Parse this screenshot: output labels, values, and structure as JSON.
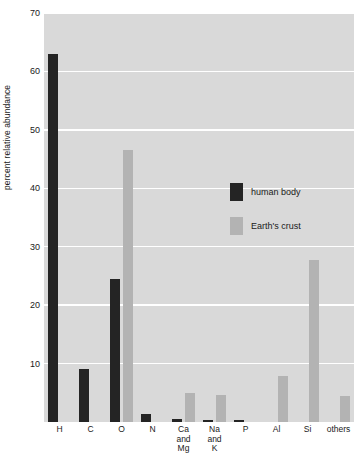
{
  "chart_data": {
    "type": "bar",
    "title": "",
    "xlabel": "",
    "ylabel": "percent relative abundance",
    "ylim": [
      0,
      70
    ],
    "yticks": [
      10,
      20,
      30,
      40,
      50,
      60,
      70
    ],
    "grid": true,
    "legend_position": "inside-upper-center",
    "categories": [
      "H",
      "C",
      "O",
      "N",
      "Ca and Mg",
      "Na and K",
      "P",
      "Al",
      "Si",
      "others"
    ],
    "category_lines": [
      [
        "H"
      ],
      [
        "C"
      ],
      [
        "O"
      ],
      [
        "N"
      ],
      [
        "Ca",
        "and",
        "Mg"
      ],
      [
        "Na",
        "and",
        "K"
      ],
      [
        "P"
      ],
      [
        "Al"
      ],
      [
        "Si"
      ],
      [
        "others"
      ]
    ],
    "series": [
      {
        "name": "human body",
        "color": "#242424",
        "values": [
          63.0,
          9.0,
          24.5,
          1.4,
          0.6,
          0.3,
          0.4,
          0.0,
          0.0,
          0.0
        ]
      },
      {
        "name": "Earth's crust",
        "color": "#b3b3b3",
        "values": [
          0.0,
          0.0,
          46.6,
          0.0,
          5.0,
          4.6,
          0.0,
          7.8,
          27.7,
          4.4
        ]
      }
    ]
  },
  "legend": {
    "items": [
      {
        "label": "human body",
        "color": "#242424"
      },
      {
        "label": "Earth's crust",
        "color": "#b3b3b3"
      }
    ]
  },
  "axis": {
    "y_title": "percent relative abundance",
    "y_tick_labels": [
      "10",
      "20",
      "30",
      "40",
      "50",
      "60",
      "70"
    ]
  }
}
